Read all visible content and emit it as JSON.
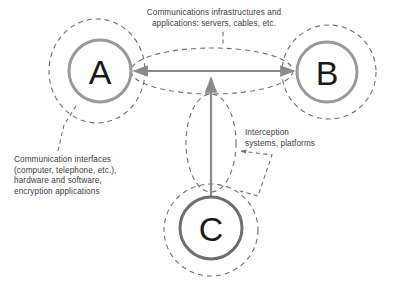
{
  "diagram": {
    "background_color": "#ffffff",
    "nodes": [
      {
        "id": "A",
        "label": "A",
        "name": "node-a",
        "cx": 100,
        "cy": 71,
        "r": 31,
        "stroke_color": "#9a9a9a",
        "stroke_width": 3,
        "halo_rx": 48,
        "halo_ry": 52,
        "halo_cx": 97,
        "halo_cy": 71
      },
      {
        "id": "B",
        "label": "B",
        "name": "node-b",
        "cx": 327,
        "cy": 72,
        "r": 30,
        "stroke_color": "#9a9a9a",
        "stroke_width": 3,
        "halo_rx": 47,
        "halo_ry": 47,
        "halo_cx": 329,
        "halo_cy": 72
      },
      {
        "id": "C",
        "label": "C",
        "name": "node-c",
        "cx": 211,
        "cy": 228,
        "r": 31,
        "stroke_color": "#6f6f6f",
        "stroke_width": 3,
        "halo_rx": 47,
        "halo_ry": 46,
        "halo_cx": 211,
        "halo_cy": 230
      }
    ],
    "connections": [
      {
        "name": "link-a-b",
        "from": "A",
        "to": "B",
        "style": "double-headed-arrow",
        "color": "#8a8a8a",
        "halo_shape": "ellipse",
        "halo_cx": 212,
        "halo_cy": 71,
        "halo_rx": 81,
        "halo_ry": 23
      },
      {
        "name": "link-c-to-ab",
        "from": "C",
        "to": "link-a-b",
        "style": "single-headed-arrow",
        "color": "#8a8a8a",
        "halo_shape": "ellipse",
        "halo_cx": 211,
        "halo_cy": 143,
        "halo_rx": 25,
        "halo_ry": 49
      }
    ],
    "annotations": [
      {
        "name": "label-infrastructures",
        "text": "Communications infrastructures and\napplications: servers, cables, etc.",
        "target": "link-a-b",
        "leader": "dashed-vertical"
      },
      {
        "name": "label-interfaces",
        "text": "Communication interfaces\n(computer, telephone, etc.),\nhardware and software,\nencryption applications",
        "target": "node-a",
        "leader": "dashed-diagonal"
      },
      {
        "name": "label-interception",
        "text": "Interception\nsystems, platforms",
        "target": "link-c-to-ab",
        "leader": "dashed-elbow-with-arrow"
      }
    ],
    "colors": {
      "node_light": "#9a9a9a",
      "node_dark": "#6f6f6f",
      "arrow": "#8a8a8a",
      "dashed": "#707070",
      "text": "#3d3d3d",
      "letter": "#1a1a1a"
    }
  }
}
